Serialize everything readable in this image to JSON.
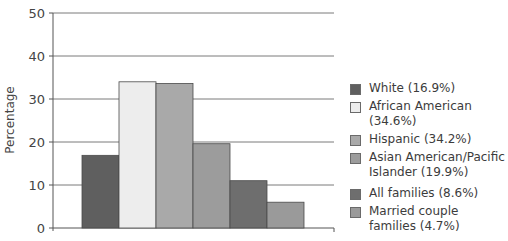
{
  "chart_data": {
    "type": "bar",
    "title": "",
    "xlabel": "",
    "ylabel": "Percentage",
    "ylim": [
      0,
      50
    ],
    "yticks": [
      0,
      10,
      20,
      30,
      40,
      50
    ],
    "grid": true,
    "legend_position": "right",
    "categories": [
      "White",
      "African American",
      "Hispanic",
      "Asian American/Pacific Islander",
      "All families",
      "Married couple families"
    ],
    "values": [
      16.9,
      34.6,
      34.2,
      19.9,
      8.6,
      4.7
    ],
    "drawn_bar_heights_estimate": [
      16.9,
      34.0,
      33.6,
      19.6,
      11.0,
      6.0
    ],
    "colors": [
      "#5f5f5f",
      "#ededed",
      "#a9a9a9",
      "#9c9c9c",
      "#6e6e6e",
      "#9a9a9a"
    ],
    "legend": [
      "White (16.9%)",
      "African American (34.6%)",
      "Hispanic (34.2%)",
      "Asian American/Pacific Islander (19.9%)",
      "All families (8.6%)",
      "Married couple families (4.7%)"
    ]
  },
  "legend_lines": [
    [
      "White (16.9%)"
    ],
    [
      "African American (34.6%)"
    ],
    [
      "Hispanic (34.2%)"
    ],
    [
      "Asian American/Pacific",
      "Islander (19.9%)"
    ],
    [
      "All families (8.6%)"
    ],
    [
      "Married couple",
      "families (4.7%)"
    ]
  ]
}
